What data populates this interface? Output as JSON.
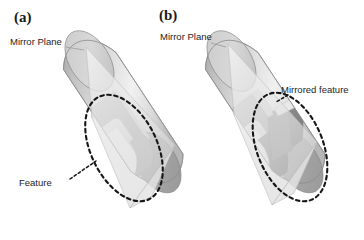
{
  "figure": {
    "background_color": "#ffffff",
    "ink_color": "#1d1d1d",
    "panels": [
      {
        "tag": "(a)",
        "mirror_plane_label": "Mirror Plane",
        "feature_label": "Feature",
        "annotation_shape": "dashed-ellipse",
        "description": "Cylinder with a single slot feature highlighted by a dashed ellipse"
      },
      {
        "tag": "(b)",
        "mirror_plane_label": "Mirror Plane",
        "feature_label": "Mirrored feature",
        "annotation_shape": "dashed-ellipse",
        "description": "Cylinder with the original slot plus its mirrored counterpart highlighted by a dashed ellipse"
      }
    ],
    "colors": {
      "cylinder_light": "#ededed",
      "cylinder_mid": "#d2d2d2",
      "cylinder_shadow": "#b4b4b4",
      "cylinder_dark": "#9a9a9a",
      "mirrored_cut_dark": "#8d8d8d",
      "plane_fill": "#e8e8e8",
      "plane_edge": "#b9b9b9",
      "outline": "#8a8a8a",
      "dashed_annotation": "#161616"
    }
  }
}
